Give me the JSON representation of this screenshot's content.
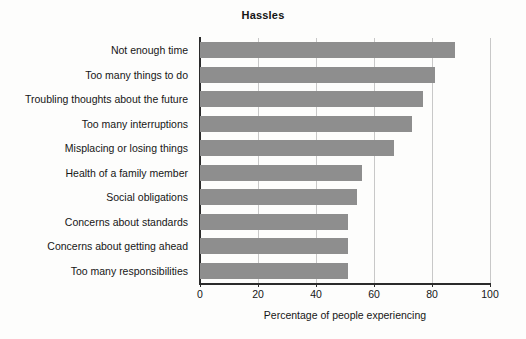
{
  "chart_data": {
    "type": "bar",
    "orientation": "horizontal",
    "title": "Hassles",
    "xlabel": "Percentage of people experiencing",
    "ylabel": "",
    "xlim": [
      0,
      100
    ],
    "xticks": [
      0,
      20,
      40,
      60,
      80,
      100
    ],
    "xtick_labels": [
      "0",
      "20",
      "40",
      "60",
      "80",
      "100"
    ],
    "grid": "vertical",
    "legend": "none",
    "bar_color": "#8e8e8e",
    "axis_color": "#2b2b2b",
    "gridline_color": "#c8c8c8",
    "categories": [
      "Not enough time",
      "Too many things to do",
      "Troubling thoughts about the future",
      "Too many interruptions",
      "Misplacing or losing things",
      "Health of a family member",
      "Social obligations",
      "Concerns about standards",
      "Concerns about getting ahead",
      "Too many responsibilities"
    ],
    "values": [
      88,
      81,
      77,
      73,
      67,
      56,
      54,
      51,
      51,
      51
    ]
  }
}
